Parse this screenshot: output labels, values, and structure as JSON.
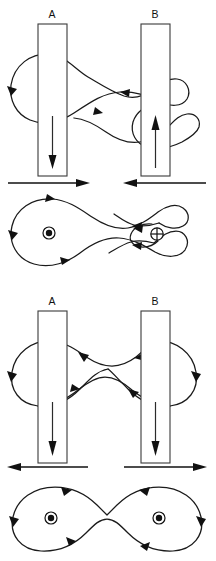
{
  "figure": {
    "background_color": "#ffffff",
    "line_color": "#111111",
    "conductor_stroke_color": "#3a3a3a",
    "width": 216,
    "height": 561
  },
  "panels": [
    {
      "id": "panel-top",
      "name": "antiparallel-currents",
      "description": "Side view of two conductors carrying antiparallel currents with resulting magnetic field lines",
      "conductors": [
        {
          "label": "A",
          "current_direction": "down",
          "label_x": 52,
          "label_y": 18,
          "rect": {
            "x": 38,
            "y": 24,
            "width": 29,
            "height": 152
          }
        },
        {
          "label": "B",
          "current_direction": "up",
          "label_x": 155,
          "label_y": 18,
          "rect": {
            "x": 141,
            "y": 24,
            "width": 29,
            "height": 152
          }
        }
      ],
      "force_arrows": [
        {
          "name": "force-arrow-left",
          "direction": "right",
          "from_x": 8,
          "to_x": 88,
          "y": 183
        },
        {
          "name": "force-arrow-right",
          "direction": "left",
          "from_x": 206,
          "to_x": 124,
          "y": 183
        }
      ],
      "force_meaning": "attraction",
      "cross_section": {
        "symbols": [
          {
            "name": "current-out-of-page",
            "glyph": "dot",
            "x": 49,
            "y": 233
          },
          {
            "name": "current-into-page",
            "glyph": "cross",
            "x": 157,
            "y": 234
          }
        ]
      }
    },
    {
      "id": "panel-bottom",
      "name": "parallel-currents",
      "description": "Side view of two conductors carrying parallel currents with resulting magnetic field lines",
      "conductors": [
        {
          "label": "A",
          "current_direction": "down",
          "label_x": 52,
          "label_y": 305,
          "rect": {
            "x": 38,
            "y": 311,
            "width": 29,
            "height": 152
          }
        },
        {
          "label": "B",
          "current_direction": "down",
          "label_x": 155,
          "label_y": 305,
          "rect": {
            "x": 141,
            "y": 311,
            "width": 29,
            "height": 152
          }
        }
      ],
      "force_arrows": [
        {
          "name": "force-arrow-left",
          "direction": "left",
          "from_x": 88,
          "to_x": 8,
          "y": 467
        },
        {
          "name": "force-arrow-right",
          "direction": "right",
          "from_x": 124,
          "to_x": 206,
          "y": 467
        }
      ],
      "force_meaning": "repulsion",
      "cross_section": {
        "symbols": [
          {
            "name": "current-out-of-page",
            "glyph": "dot",
            "x": 51,
            "y": 518
          },
          {
            "name": "current-out-of-page",
            "glyph": "dot",
            "x": 159,
            "y": 518
          }
        ]
      }
    }
  ],
  "labels": {
    "conductor_a": "A",
    "conductor_b": "B"
  }
}
